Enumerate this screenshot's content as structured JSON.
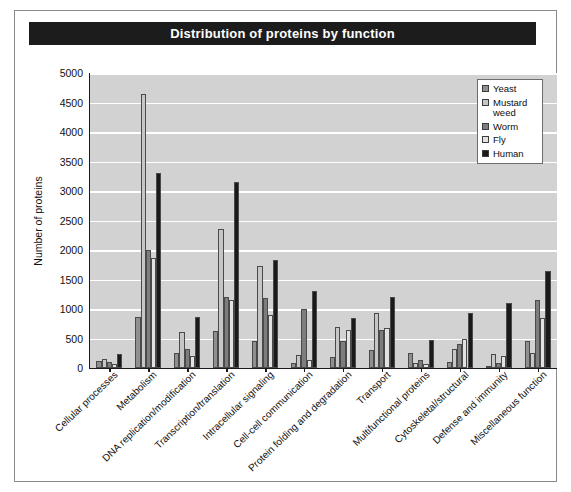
{
  "figure": {
    "title": "Distribution of proteins by function"
  },
  "legend": {
    "position": "top-right",
    "entries": [
      {
        "label": "Yeast",
        "color": "#8f8f8f"
      },
      {
        "label": "Mustard weed",
        "color": "#c6c6c6"
      },
      {
        "label": "Worm",
        "color": "#7d7d7d"
      },
      {
        "label": "Fly",
        "color": "#e2e2e2"
      },
      {
        "label": "Human",
        "color": "#1a1a1a"
      }
    ]
  },
  "axes": {
    "ylabel": "Number of proteins",
    "yticks": [
      0,
      500,
      1000,
      1500,
      2000,
      2500,
      3000,
      3500,
      4000,
      4500,
      5000
    ],
    "ylim": [
      0,
      5000
    ],
    "xlabel": ""
  },
  "chart_data": {
    "type": "bar",
    "title": "Distribution of proteins by function",
    "xlabel": "",
    "ylabel": "Number of proteins",
    "ylim": [
      0,
      5000
    ],
    "grid": true,
    "legend_position": "top-right",
    "categories": [
      "Cellular processes",
      "Metabolism",
      "DNA replication/modification",
      "Transcription/translation",
      "Intracellular signaling",
      "Cell-cell communication",
      "Protein folding and degradation",
      "Transport",
      "Multifunctional proteins",
      "Cytoskeletal/structural",
      "Defense and immunity",
      "Miscellaneous function"
    ],
    "series": [
      {
        "name": "Yeast",
        "color": "#8f8f8f",
        "values": [
          120,
          870,
          260,
          620,
          450,
          90,
          190,
          300,
          250,
          110,
          40,
          450
        ]
      },
      {
        "name": "Mustard weed",
        "color": "#c6c6c6",
        "values": [
          160,
          4650,
          610,
          2350,
          1730,
          220,
          700,
          940,
          90,
          330,
          230,
          250
        ]
      },
      {
        "name": "Worm",
        "color": "#7d7d7d",
        "values": [
          110,
          2000,
          320,
          1200,
          1180,
          1000,
          450,
          650,
          130,
          400,
          90,
          1150
        ]
      },
      {
        "name": "Fly",
        "color": "#e2e2e2",
        "values": [
          60,
          1870,
          200,
          1150,
          900,
          140,
          650,
          680,
          70,
          500,
          200,
          850
        ]
      },
      {
        "name": "Human",
        "color": "#1a1a1a",
        "values": [
          230,
          3300,
          870,
          3150,
          1830,
          1300,
          840,
          1200,
          470,
          940,
          1100,
          1650
        ]
      }
    ]
  }
}
